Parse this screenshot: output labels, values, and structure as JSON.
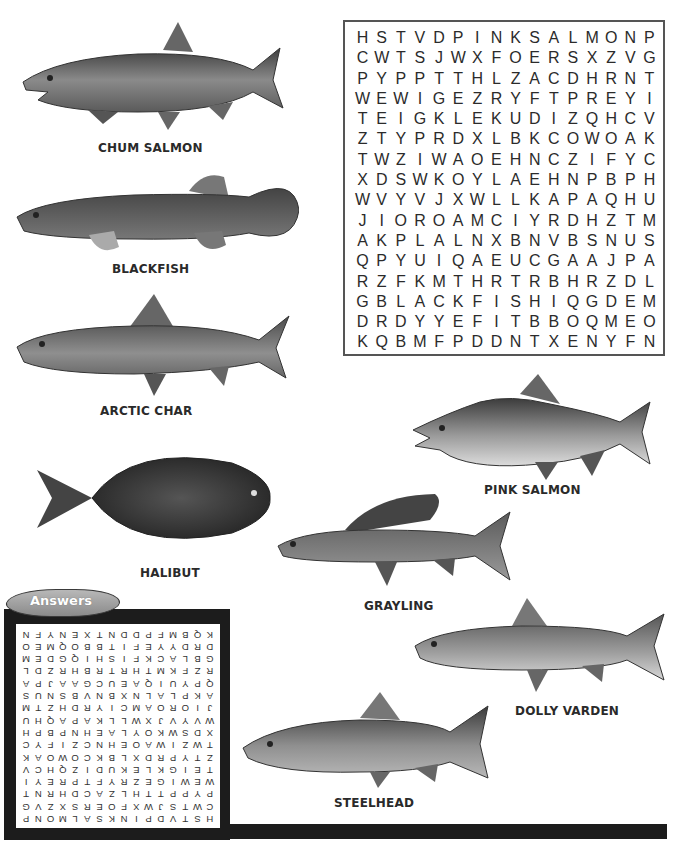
{
  "puzzle": {
    "grid": [
      [
        "H",
        "S",
        "T",
        "V",
        "D",
        "P",
        "I",
        "N",
        "K",
        "S",
        "A",
        "L",
        "M",
        "O",
        "N",
        "P"
      ],
      [
        "C",
        "W",
        "T",
        "S",
        "J",
        "W",
        "X",
        "F",
        "O",
        "E",
        "R",
        "S",
        "X",
        "Z",
        "V",
        "G"
      ],
      [
        "P",
        "Y",
        "P",
        "P",
        "T",
        "T",
        "H",
        "L",
        "Z",
        "A",
        "C",
        "D",
        "H",
        "R",
        "N",
        "T"
      ],
      [
        "W",
        "E",
        "W",
        "I",
        "G",
        "E",
        "Z",
        "R",
        "Y",
        "F",
        "T",
        "P",
        "R",
        "E",
        "Y",
        "I"
      ],
      [
        "T",
        "E",
        "I",
        "G",
        "K",
        "L",
        "E",
        "K",
        "U",
        "D",
        "I",
        "Z",
        "Q",
        "H",
        "C",
        "V"
      ],
      [
        "Z",
        "T",
        "Y",
        "P",
        "R",
        "D",
        "X",
        "L",
        "B",
        "K",
        "C",
        "O",
        "W",
        "O",
        "A",
        "K"
      ],
      [
        "T",
        "W",
        "Z",
        "I",
        "W",
        "A",
        "O",
        "E",
        "H",
        "N",
        "C",
        "Z",
        "I",
        "F",
        "Y",
        "C"
      ],
      [
        "X",
        "D",
        "S",
        "W",
        "K",
        "O",
        "Y",
        "L",
        "A",
        "E",
        "H",
        "N",
        "P",
        "B",
        "P",
        "H"
      ],
      [
        "W",
        "V",
        "Y",
        "V",
        "J",
        "X",
        "W",
        "L",
        "L",
        "K",
        "A",
        "P",
        "A",
        "Q",
        "H",
        "U"
      ],
      [
        "J",
        "I",
        "O",
        "R",
        "O",
        "A",
        "M",
        "C",
        "I",
        "Y",
        "R",
        "D",
        "H",
        "Z",
        "T",
        "M"
      ],
      [
        "A",
        "K",
        "P",
        "L",
        "A",
        "L",
        "N",
        "X",
        "B",
        "N",
        "V",
        "B",
        "S",
        "N",
        "U",
        "S"
      ],
      [
        "Q",
        "P",
        "Y",
        "U",
        "I",
        "Q",
        "A",
        "E",
        "U",
        "C",
        "G",
        "A",
        "A",
        "J",
        "P",
        "A"
      ],
      [
        "R",
        "Z",
        "F",
        "K",
        "M",
        "T",
        "H",
        "R",
        "T",
        "R",
        "B",
        "H",
        "R",
        "Z",
        "D",
        "L"
      ],
      [
        "G",
        "B",
        "L",
        "A",
        "C",
        "K",
        "F",
        "I",
        "S",
        "H",
        "I",
        "Q",
        "G",
        "D",
        "E",
        "M"
      ],
      [
        "D",
        "R",
        "D",
        "Y",
        "Y",
        "E",
        "F",
        "I",
        "T",
        "B",
        "B",
        "O",
        "Q",
        "M",
        "E",
        "O"
      ],
      [
        "K",
        "Q",
        "B",
        "M",
        "F",
        "P",
        "D",
        "D",
        "N",
        "T",
        "X",
        "E",
        "N",
        "Y",
        "F",
        "N"
      ]
    ]
  },
  "fish": [
    {
      "id": "chum-salmon",
      "label": "CHUM SALMON"
    },
    {
      "id": "blackfish",
      "label": "BLACKFISH"
    },
    {
      "id": "arctic-char",
      "label": "ARCTIC CHAR"
    },
    {
      "id": "pink-salmon",
      "label": "PINK SALMON"
    },
    {
      "id": "halibut",
      "label": "HALIBUT"
    },
    {
      "id": "grayling",
      "label": "GRAYLING"
    },
    {
      "id": "dolly-varden",
      "label": "DOLLY VARDEN"
    },
    {
      "id": "steelhead",
      "label": "STEELHEAD"
    }
  ],
  "answers": {
    "tab_label": "Answers",
    "orientation": "upside-down"
  },
  "colors": {
    "frame": "#1c1c1c",
    "grid_border": "#555555",
    "tab": "#9a9a9a",
    "text": "#2a2a2a"
  }
}
